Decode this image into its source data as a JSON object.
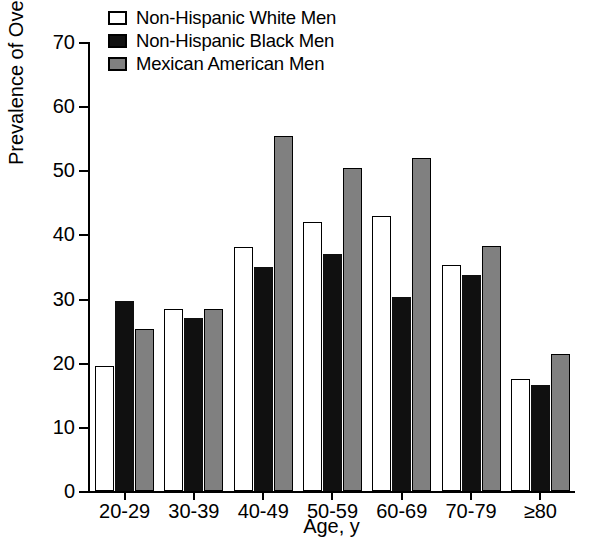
{
  "chart_data": {
    "type": "bar",
    "title": "",
    "xlabel": "Age, y",
    "ylabel": "Prevalence of Overweight, %",
    "ylim": [
      0,
      70
    ],
    "yticks": [
      0,
      10,
      20,
      30,
      40,
      50,
      60,
      70
    ],
    "ytick_labels": [
      "0",
      "10",
      "20",
      "30",
      "40",
      "50",
      "60",
      "70"
    ],
    "grid": false,
    "legend_position": "top-left",
    "categories": [
      "20-29",
      "30-39",
      "40-49",
      "50-59",
      "60-69",
      "70-79",
      "≥80"
    ],
    "series": [
      {
        "name": "Non-Hispanic White Men",
        "color": "#ffffff",
        "values": [
          19.5,
          28.4,
          38.1,
          42.0,
          42.8,
          35.3,
          17.5
        ]
      },
      {
        "name": "Non-Hispanic Black Men",
        "color": "#101010",
        "values": [
          29.6,
          26.9,
          35.0,
          36.9,
          30.3,
          33.7,
          16.5
        ]
      },
      {
        "name": "Mexican American Men",
        "color": "#808080",
        "values": [
          25.3,
          28.3,
          55.4,
          50.3,
          51.9,
          38.2,
          21.4
        ]
      }
    ]
  },
  "legend": {
    "items": [
      {
        "label": "Non-Hispanic White Men",
        "swatch": "white-swatch-icon"
      },
      {
        "label": "Non-Hispanic Black Men",
        "swatch": "black-swatch-icon"
      },
      {
        "label": "Mexican American Men",
        "swatch": "gray-swatch-icon"
      }
    ]
  }
}
